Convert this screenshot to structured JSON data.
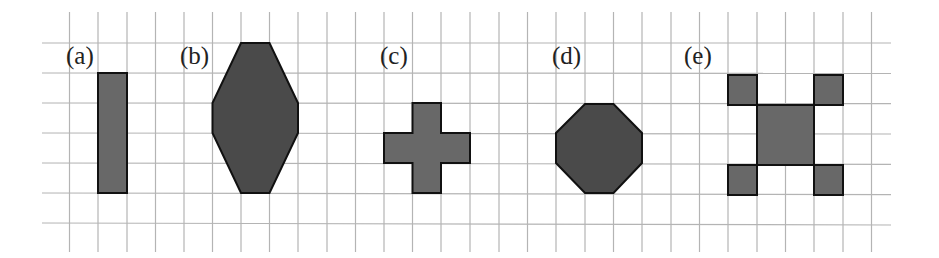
{
  "figure": {
    "type": "grid-shapes",
    "grid": {
      "color": "#b4b4b4",
      "vertical_lines_x": [
        69.5,
        98,
        127,
        155.5,
        184,
        212.5,
        241,
        269.5,
        298,
        327,
        355.5,
        384,
        412.5,
        441,
        470,
        499,
        527.5,
        556,
        585,
        613.5,
        642,
        671,
        699.5,
        728,
        757,
        785.5,
        814,
        843,
        871.5
      ],
      "horizontal_lines_y": [
        43,
        73,
        103,
        133,
        163,
        193,
        223
      ],
      "v_top": 12,
      "v_bottom": 252,
      "h_left": 42,
      "h_right": 891
    },
    "shapes": [
      {
        "label": "(a)",
        "label_x": 66,
        "label_y": 64,
        "name": "rectangle",
        "fill": "#686868",
        "points": "98,73 127,73 127,193 98,193"
      },
      {
        "label": "(b)",
        "label_x": 180,
        "label_y": 64,
        "name": "elongated-octagon",
        "fill": "#4a4a4a",
        "points": "241,43 269.5,43 298,103 298,133 269.5,193 241,193 212.5,133 212.5,103"
      },
      {
        "label": "(c)",
        "label_x": 380,
        "label_y": 64,
        "name": "cross",
        "fill": "#686868",
        "points": "412.5,103 441,103 441,133 470,133 470,163 441,163 441,193 412.5,193 412.5,163 384,163 384,133 412.5,133"
      },
      {
        "label": "(d)",
        "label_x": 552,
        "label_y": 64,
        "name": "octagon",
        "fill": "#4a4a4a",
        "points": "585,104 613.5,104 642,133 642,163 613.5,193 585,193 556,163 556,133"
      },
      {
        "label": "(e)",
        "label_x": 684,
        "label_y": 64,
        "name": "square-with-corner-squares",
        "fill": "#686868",
        "parts": [
          "728,75 757,75 757,105 728,105",
          "814,75 843,75 843,105 814,105",
          "757,105 814,105 814,165 757,165",
          "728,165 757,165 757,195 728,195",
          "814,165 843,165 843,195 814,195"
        ]
      }
    ]
  }
}
